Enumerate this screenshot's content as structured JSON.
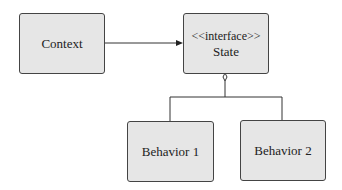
{
  "diagram": {
    "nodes": [
      {
        "id": "context",
        "label": "Context"
      },
      {
        "id": "state",
        "stereotype": "<<interface>>",
        "label": "State"
      },
      {
        "id": "behavior1",
        "label": "Behavior 1"
      },
      {
        "id": "behavior2",
        "label": "Behavior 2"
      }
    ],
    "edges": [
      {
        "from": "context",
        "to": "state",
        "type": "association-arrow"
      },
      {
        "from": "behavior1",
        "to": "state",
        "type": "realization"
      },
      {
        "from": "behavior2",
        "to": "state",
        "type": "realization"
      }
    ],
    "colors": {
      "box_fill": "#e6e6e6",
      "border": "#444444",
      "line": "#333333"
    }
  }
}
